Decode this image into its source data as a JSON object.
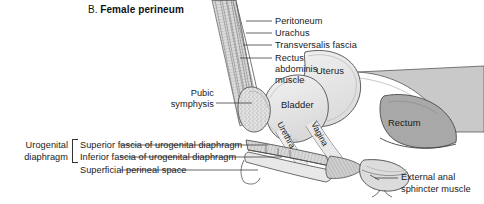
{
  "figure": {
    "panel_letter": "B.",
    "title": "Female perineum",
    "background_color": "#ffffff"
  },
  "labels": {
    "peritoneum": "Peritoneum",
    "urachus": "Urachus",
    "transversalis_fascia": "Transversalis fascia",
    "rectus_line1": "Rectus",
    "rectus_line2": "abdominis",
    "rectus_line3": "muscle",
    "pubic_line1": "Pubic",
    "pubic_line2": "symphysis",
    "uterus": "Uterus",
    "bladder": "Bladder",
    "urethra": "Urethra",
    "vagina": "Vagina",
    "rectum": "Rectum",
    "urogenital_line1": "Urogenital",
    "urogenital_line2": "diaphragm",
    "superior_fascia": "Superior fascia of urogenital diaphragm",
    "inferior_fascia": "Inferior fascia of urogenital diaphragm",
    "superficial_space": "Superficial perineal space",
    "external_anal_line1": "External anal",
    "external_anal_line2": "sphincter muscle"
  },
  "colors": {
    "outline": "#4a4a4a",
    "uterus_fill": "#ececec",
    "bladder_fill": "#e6e6e6",
    "rectum_fill": "#a8a8a8",
    "muscle_fill": "#d2d2d2",
    "bone_fill": "#e0e0e0",
    "text": "#1a1a1a",
    "leader": "#333333"
  }
}
